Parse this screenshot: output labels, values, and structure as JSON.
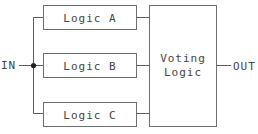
{
  "diagram": {
    "input_label": "IN",
    "output_label": "OUT",
    "logic_blocks": [
      {
        "label": "Logic A"
      },
      {
        "label": "Logic B"
      },
      {
        "label": "Logic C"
      }
    ],
    "voter": {
      "line1": "Voting",
      "line2": "Logic"
    },
    "colors": {
      "stroke": "#6e6e6e",
      "text": "#444444",
      "junction": "#222222",
      "background": "#ffffff"
    }
  }
}
